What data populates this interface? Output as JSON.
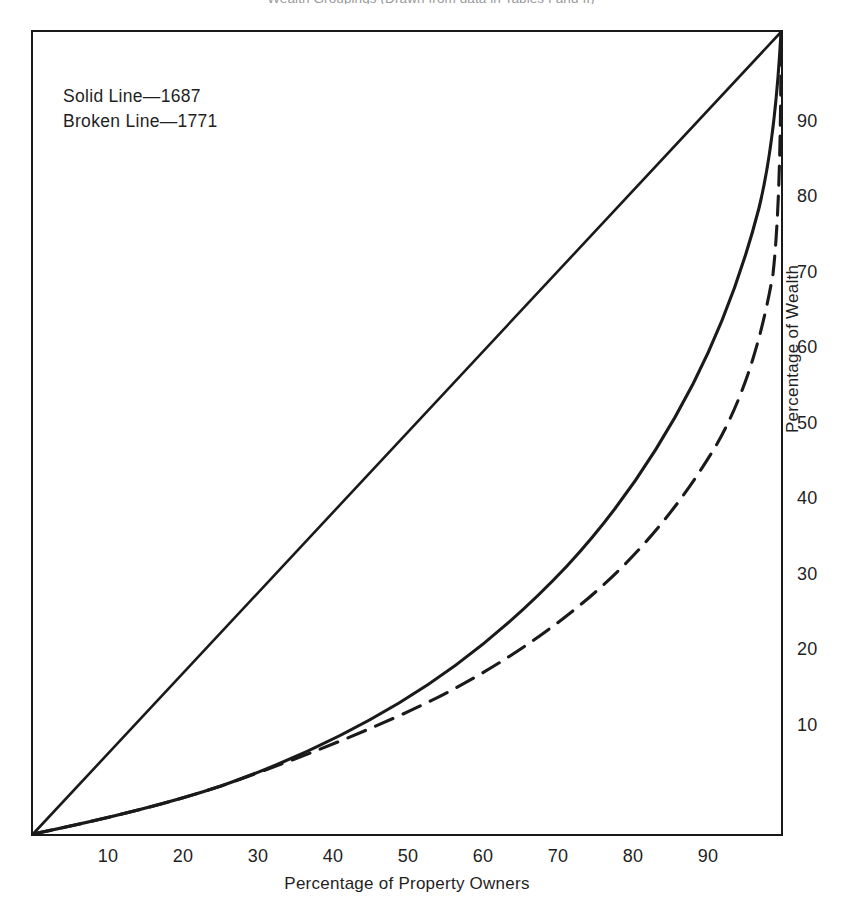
{
  "caption": "Wealth Groupings (Drawn from data in Tables I and II)",
  "legend": {
    "solid": "Solid Line—1687",
    "broken": "Broken Line—1771"
  },
  "axes": {
    "xlabel": "Percentage of Property Owners",
    "ylabel": "Percentage of Wealth",
    "xticks": [
      "10",
      "20",
      "30",
      "40",
      "50",
      "60",
      "70",
      "80",
      "90"
    ],
    "yticks": [
      "10",
      "20",
      "30",
      "40",
      "50",
      "60",
      "70",
      "80",
      "90"
    ]
  },
  "chart_data": {
    "type": "line",
    "title": "Wealth Groupings (Drawn from data in Tables I and II)",
    "xlabel": "Percentage of Property Owners",
    "ylabel": "Percentage of Wealth",
    "xlim": [
      0,
      100
    ],
    "ylim": [
      0,
      100
    ],
    "grid": false,
    "legend_position": "upper-left-inside",
    "axis_notes": "x tick labels along bottom, y tick labels along right-hand side; no tick marks drawn",
    "series": [
      {
        "name": "Line of equality",
        "style": "solid",
        "color": "#1a1a1a",
        "x": [
          0,
          100
        ],
        "y": [
          0,
          100
        ]
      },
      {
        "name": "Solid Line—1687",
        "style": "solid",
        "color": "#1a1a1a",
        "x": [
          0,
          10,
          20,
          30,
          40,
          50,
          60,
          70,
          80,
          85,
          90,
          93,
          95,
          97,
          98,
          99,
          100
        ],
        "y": [
          0,
          1.5,
          3.5,
          6,
          9.5,
          14.5,
          21,
          29,
          40,
          47.5,
          57,
          64,
          70,
          78,
          83,
          90,
          100
        ]
      },
      {
        "name": "Broken Line—1771",
        "style": "dashed",
        "color": "#1a1a1a",
        "x": [
          0,
          10,
          20,
          30,
          40,
          50,
          55,
          60,
          70,
          80,
          85,
          90,
          93,
          95,
          97,
          98,
          99,
          100
        ],
        "y": [
          0,
          1.5,
          3.5,
          6,
          9.5,
          14.5,
          16.5,
          19.5,
          25.5,
          33.5,
          39,
          46.5,
          52.5,
          58,
          67,
          74,
          85,
          100
        ]
      }
    ]
  }
}
